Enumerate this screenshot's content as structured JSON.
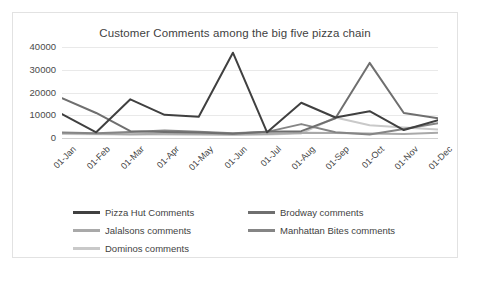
{
  "chart_data": {
    "type": "line",
    "title": "Customer Comments among the big five pizza chain",
    "xlabel": "",
    "ylabel": "",
    "ylim": [
      0,
      40000
    ],
    "yticks": [
      0,
      10000,
      20000,
      30000,
      40000
    ],
    "ytick_labels": [
      "0",
      "10000",
      "20000",
      "30000",
      "40000"
    ],
    "grid": true,
    "legend_position": "bottom",
    "categories": [
      "01-Jan",
      "01-Feb",
      "01-Mar",
      "01-Apr",
      "01-May",
      "01-Jun",
      "01-Jul",
      "01-Aug",
      "01-Sep",
      "01-Oct",
      "01-Nov",
      "01-Dec"
    ],
    "series": [
      {
        "name": "Pizza Hut Comments",
        "color": "#404040",
        "values": [
          10500,
          2500,
          17000,
          10200,
          9300,
          37500,
          2500,
          15500,
          9000,
          11800,
          3500,
          7800
        ]
      },
      {
        "name": "Brodway comments",
        "color": "#6f6f6f",
        "values": [
          17500,
          11000,
          3000,
          2600,
          2400,
          1900,
          2700,
          3000,
          8700,
          33000,
          11000,
          8700
        ]
      },
      {
        "name": "Jalalsons comments",
        "color": "#a9a9a9",
        "values": [
          2200,
          1900,
          1700,
          1900,
          1800,
          1600,
          1800,
          2300,
          2200,
          2000,
          1800,
          2300
        ]
      },
      {
        "name": "Manhattan Bites comments",
        "color": "#858585",
        "values": [
          2400,
          2100,
          2600,
          3300,
          2800,
          2100,
          2700,
          6100,
          2500,
          1500,
          4000,
          6500
        ]
      },
      {
        "name": "Dominos comments",
        "color": "#c9c9c9",
        "values": [
          1800,
          1600,
          1500,
          1500,
          1400,
          1300,
          1500,
          2000,
          9000,
          5600,
          4600,
          3700
        ]
      }
    ]
  },
  "caption": {
    "text": ""
  }
}
